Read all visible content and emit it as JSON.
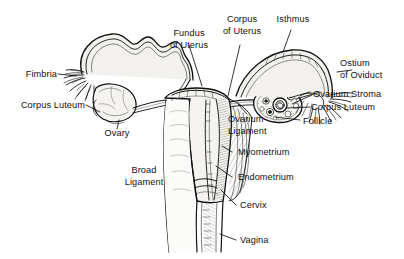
{
  "figure": {
    "style": "scanned pen-and-ink anatomical line drawing",
    "background_color": "#ffffff",
    "ink_color": "#111111",
    "organ_fill_color": "#f2f1ee"
  },
  "labels": [
    {
      "id": "fimbria",
      "text": "Fimbria",
      "lines": [
        "Fimbria"
      ]
    },
    {
      "id": "corpus-luteum-left",
      "text": "Corpus Luteum",
      "lines": [
        "Corpus Luteum"
      ]
    },
    {
      "id": "ovary",
      "text": "Ovary",
      "lines": [
        "Ovary"
      ]
    },
    {
      "id": "broad-ligament",
      "text": "Broad Ligament",
      "lines": [
        "Broad",
        "Ligament"
      ]
    },
    {
      "id": "fundus-of-uterus",
      "text": "Fundus of Uterus",
      "lines": [
        "Fundus",
        "of Uterus"
      ]
    },
    {
      "id": "corpus-of-uterus",
      "text": "Corpus of Uterus",
      "lines": [
        "Corpus",
        "of Uterus"
      ]
    },
    {
      "id": "isthmus",
      "text": "Isthmus",
      "lines": [
        "Isthmus"
      ]
    },
    {
      "id": "ostium-of-oviduct",
      "text": "Ostium of Oviduct",
      "lines": [
        "Ostium",
        "of Oviduct"
      ]
    },
    {
      "id": "ovarium-stroma",
      "text": "Ovarium Stroma",
      "lines": [
        "Ovarium Stroma"
      ]
    },
    {
      "id": "corpus-luteum-right",
      "text": "Corpus Luteum",
      "lines": [
        "Corpus Luteum"
      ]
    },
    {
      "id": "follicle",
      "text": "Follicle",
      "lines": [
        "Follicle"
      ]
    },
    {
      "id": "ovarium-ligament",
      "text": "Ovarium Ligament",
      "lines": [
        "Ovarium",
        "Ligament"
      ]
    },
    {
      "id": "myometrium",
      "text": "Myometrium",
      "lines": [
        "Myometrium"
      ]
    },
    {
      "id": "endometrium",
      "text": "Endometrium",
      "lines": [
        "Endometrium"
      ]
    },
    {
      "id": "cervix",
      "text": "Cervix",
      "lines": [
        "Cervix"
      ]
    },
    {
      "id": "vagina",
      "text": "Vagina",
      "lines": [
        "Vagina"
      ]
    }
  ],
  "label_text": {
    "fimbria": "Fimbria",
    "corpus_luteum_left": "Corpus Luteum",
    "ovary": "Ovary",
    "broad_1": "Broad",
    "broad_2": "Ligament",
    "fundus_1": "Fundus",
    "fundus_2": "of Uterus",
    "corpus_1": "Corpus",
    "corpus_2": "of Uterus",
    "isthmus": "Isthmus",
    "ostium_1": "Ostium",
    "ostium_2": "of Oviduct",
    "ovarium_stroma": "Ovarium Stroma",
    "corpus_luteum_right": "Corpus Luteum",
    "follicle": "Follicle",
    "ovarium_lig_1": "Ovarium",
    "ovarium_lig_2": "Ligament",
    "myometrium": "Myometrium",
    "endometrium": "Endometrium",
    "cervix": "Cervix",
    "vagina": "Vagina"
  },
  "structures": [
    "left oviduct (fallopian tube, convoluted)",
    "left fimbria fringe",
    "left ovary with corpus luteum",
    "uterine fundus",
    "uterine corpus (body) with cavity",
    "myometrium (hatched muscular wall)",
    "endometrium (inner lining)",
    "cervix",
    "vagina",
    "broad ligament (shaded membrane)",
    "right ovarian ligament",
    "right ovary with follicles, stroma and corpus luteum",
    "right oviduct with isthmus",
    "right ostium of oviduct with fimbriae"
  ]
}
